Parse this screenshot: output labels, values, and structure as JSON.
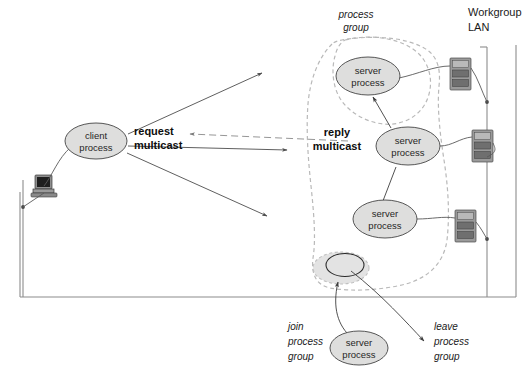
{
  "diagram": {
    "network_label_line1": "Workgroup",
    "network_label_line2": "LAN",
    "group_label_line1": "process",
    "group_label_line2": "group",
    "request_label_line1": "request",
    "request_label_line2": "multicast",
    "reply_label_line1": "reply",
    "reply_label_line2": "multicast",
    "join_label_line1": "join",
    "join_label_line2": "process",
    "join_label_line3": "group",
    "leave_label_line1": "leave",
    "leave_label_line2": "process",
    "leave_label_line3": "group",
    "colors": {
      "node_fill": "#dededd",
      "node_stroke": "#444444",
      "group_outline": "#b9b9b9",
      "frame": "#8c8c8c",
      "arrow": "#4d4d4d",
      "text": "#1a1a1a",
      "background": "#ffffff"
    },
    "nodes": [
      {
        "id": "client",
        "label_line1": "client",
        "label_line2": "process",
        "cx": 96,
        "cy": 141,
        "rx": 31,
        "ry": 18
      },
      {
        "id": "server1",
        "label_line1": "server",
        "label_line2": "process",
        "cx": 368,
        "cy": 76,
        "rx": 32,
        "ry": 19
      },
      {
        "id": "server2",
        "label_line1": "server",
        "label_line2": "process",
        "cx": 408,
        "cy": 146,
        "rx": 32,
        "ry": 19
      },
      {
        "id": "server3",
        "label_line1": "server",
        "label_line2": "process",
        "cx": 385,
        "cy": 219,
        "rx": 32,
        "ry": 19
      },
      {
        "id": "server4",
        "label_line1": "server",
        "label_line2": "process",
        "cx": 359,
        "cy": 348,
        "rx": 29,
        "ry": 17
      }
    ],
    "machines": [
      {
        "id": "client-workstation",
        "kind": "desktop-pc",
        "x": 31,
        "y": 175
      },
      {
        "id": "server-host-1",
        "kind": "server-tower",
        "x": 450,
        "y": 58
      },
      {
        "id": "server-host-2",
        "kind": "server-tower",
        "x": 472,
        "y": 130
      },
      {
        "id": "server-host-3",
        "kind": "server-tower",
        "x": 455,
        "y": 210
      }
    ],
    "empty_slot": {
      "id": "empty-group-slot",
      "cx": 341,
      "cy": 268,
      "rx": 19,
      "ry": 12
    }
  }
}
